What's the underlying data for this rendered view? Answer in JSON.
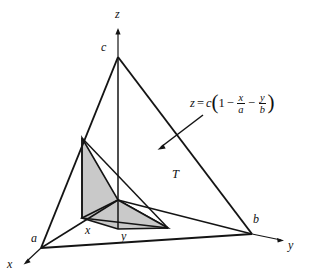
{
  "figure": {
    "kind": "3d-tetrahedron-solid-diagram",
    "background_color": "#ffffff",
    "line_color": "#141414",
    "shaded_region_color": "#c9c9c9",
    "axes": [
      {
        "name": "z-axis",
        "label": "z",
        "direction": "up"
      },
      {
        "name": "y-axis",
        "label": "y",
        "direction": "right"
      },
      {
        "name": "x-axis",
        "label": "x",
        "direction": "down-left"
      }
    ],
    "vertices": [
      {
        "name": "apex-vertex",
        "label": "c",
        "axis": "z"
      },
      {
        "name": "x-intercept-vertex",
        "label": "a",
        "axis": "x"
      },
      {
        "name": "y-intercept-vertex",
        "label": "b",
        "axis": "y"
      }
    ],
    "base_marks": [
      {
        "name": "x-coordinate-mark",
        "label": "x"
      },
      {
        "name": "y-coordinate-mark",
        "label": "y"
      }
    ],
    "region_label": "T",
    "plane_equation": {
      "lhs": "z",
      "equals": "=",
      "coefficient": "c",
      "open_paren": "(",
      "one": "1",
      "minus_1": "−",
      "term1_num": "x",
      "term1_den": "a",
      "minus_2": "−",
      "term2_num": "y",
      "term2_den": "b",
      "close_paren": ")"
    }
  }
}
